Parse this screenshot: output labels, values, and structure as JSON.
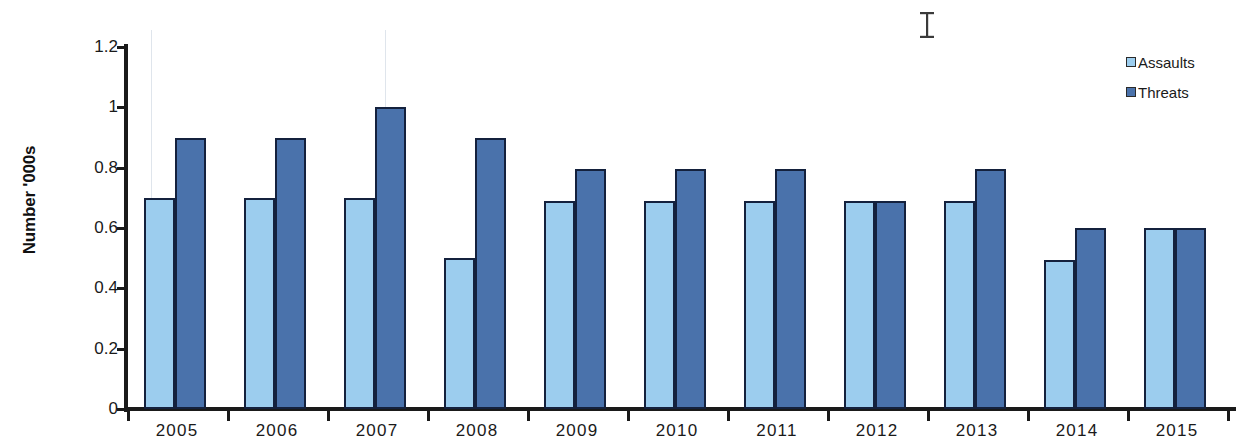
{
  "chart_data": {
    "type": "bar",
    "title": "",
    "subtitle": "",
    "xlabel": "",
    "ylabel": "Number '000s",
    "categories": [
      "2005",
      "2006",
      "2007",
      "2008",
      "2009",
      "2010",
      "2011",
      "2012",
      "2013",
      "2014",
      "2015"
    ],
    "series": [
      {
        "name": "Assaults",
        "color": "#9ccdee",
        "values": [
          0.7,
          0.7,
          0.7,
          0.5,
          0.69,
          0.69,
          0.69,
          0.69,
          0.69,
          0.495,
          0.6
        ]
      },
      {
        "name": "Threats",
        "color": "#4a72ab",
        "values": [
          0.9,
          0.9,
          1.0,
          0.9,
          0.795,
          0.795,
          0.795,
          0.69,
          0.795,
          0.6,
          0.6
        ]
      }
    ],
    "ylim": [
      0,
      1.2
    ],
    "y_ticks": [
      "0",
      "0.2",
      "0.4",
      "0.6",
      "0.8",
      "1",
      "1.2"
    ],
    "y_tick_values": [
      0,
      0.2,
      0.4,
      0.6,
      0.8,
      1.0,
      1.2
    ],
    "grid": false,
    "legend_position": "top-right"
  },
  "legend": {
    "items": [
      {
        "label": "Assaults",
        "swatch": "assaults"
      },
      {
        "label": "Threats",
        "swatch": "threats"
      }
    ]
  },
  "artifacts": {
    "cursor": "text-ibeam-cursor"
  },
  "colors": {
    "assaults": "#9ccdee",
    "threats": "#4a72ab",
    "bar_outline": "#14213d",
    "axis": "#1a1a1a",
    "background": "#ffffff"
  }
}
